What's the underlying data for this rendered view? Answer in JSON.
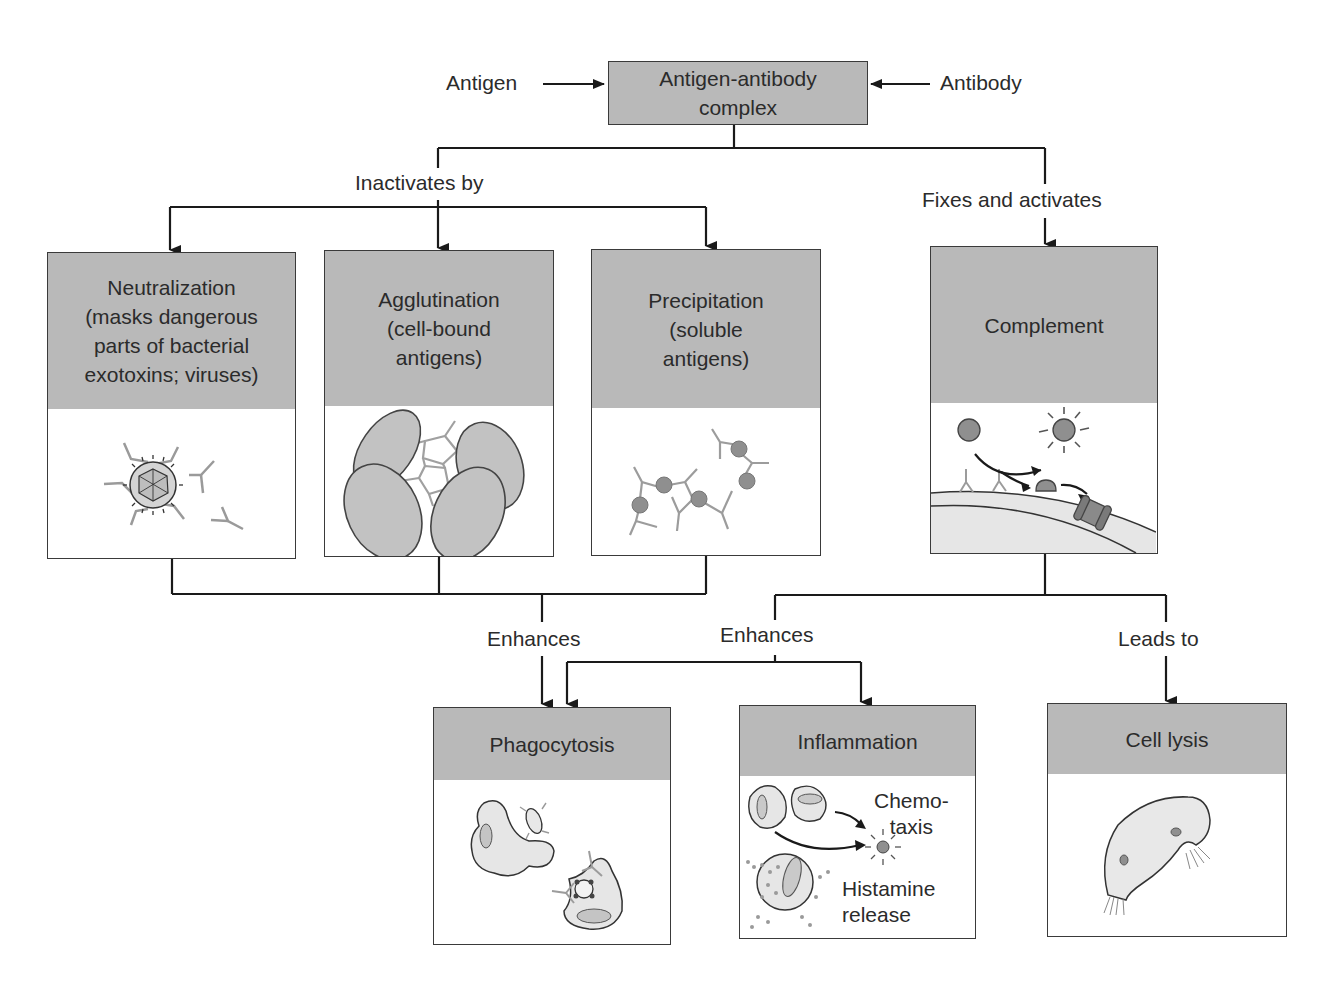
{
  "diagram": {
    "type": "flowchart",
    "title_cutoff": "",
    "colors": {
      "box_header_fill": "#b9b9b9",
      "box_border": "#3a3a3a",
      "line": "#1a1a1a",
      "illustration_gray": "#8f8f8f",
      "illustration_light": "#e4e4e4"
    }
  },
  "top": {
    "left_label": "Antigen",
    "right_label": "Antibody",
    "complex_box": "Antigen-antibody\ncomplex"
  },
  "branch_labels": {
    "inactivates": "Inactivates by",
    "fixes": "Fixes and activates",
    "enhances_left": "Enhances",
    "enhances_right": "Enhances",
    "leads_to": "Leads to"
  },
  "middle_row": [
    {
      "id": "neutralization",
      "title": "Neutralization\n(masks dangerous\nparts of bacterial\nexotoxins; viruses)",
      "illustration": "virus-coated-by-antibodies"
    },
    {
      "id": "agglutination",
      "title": "Agglutination\n(cell-bound\nantigens)",
      "illustration": "clumped-cells-with-antibodies"
    },
    {
      "id": "precipitation",
      "title": "Precipitation\n(soluble\nantigens)",
      "illustration": "antigen-antibody-lattice"
    },
    {
      "id": "complement",
      "title": "Complement",
      "illustration": "complement-activation-on-membrane"
    }
  ],
  "bottom_row": [
    {
      "id": "phagocytosis",
      "title": "Phagocytosis",
      "illustration": "phagocytes-engulfing"
    },
    {
      "id": "inflammation",
      "title": "Inflammation",
      "illustration": "chemotaxis-and-histamine",
      "notes": [
        "Chemo-\ntaxis",
        "Histamine\nrelease"
      ]
    },
    {
      "id": "cell_lysis",
      "title": "Cell lysis",
      "illustration": "lysing-cell"
    }
  ]
}
